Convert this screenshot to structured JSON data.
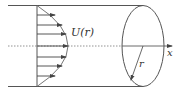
{
  "diagram": {
    "labels": {
      "velocity": "U(r)",
      "axis": "x",
      "radius": "r"
    },
    "colors": {
      "stroke": "#444444",
      "background": "#ffffff"
    },
    "arrows_count": 7
  }
}
